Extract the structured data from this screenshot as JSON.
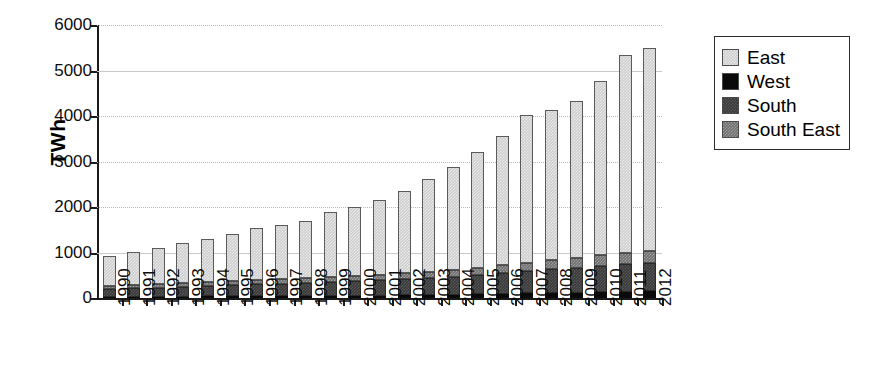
{
  "chart_data": {
    "type": "bar",
    "subtype": "stacked-column",
    "title": "",
    "xlabel": "",
    "ylabel": "TWh",
    "ylim": [
      0,
      6000
    ],
    "ytick_step": 1000,
    "yticks": [
      "6000",
      "5000",
      "4000",
      "3000",
      "2000",
      "1000",
      "0"
    ],
    "grid": true,
    "grid_axis": "y",
    "legend_position": "right-top",
    "legend_entries": [
      "East",
      "West",
      "South",
      "South East"
    ],
    "categories": [
      "1990",
      "1991",
      "1992",
      "1993",
      "1994",
      "1995",
      "1996",
      "1997",
      "1998",
      "1999",
      "2000",
      "2001",
      "2002",
      "2003",
      "2004",
      "2005",
      "2006",
      "2007",
      "2008",
      "2009",
      "2010",
      "2011",
      "2012"
    ],
    "series": [
      {
        "name": "South East",
        "color": "#6e6e6e",
        "values": [
          60,
          65,
          70,
          75,
          80,
          85,
          90,
          95,
          100,
          105,
          110,
          115,
          125,
          135,
          145,
          160,
          175,
          190,
          205,
          220,
          235,
          250,
          265
        ]
      },
      {
        "name": "South",
        "color": "#3a3a3a",
        "values": [
          180,
          190,
          200,
          215,
          230,
          245,
          260,
          275,
          290,
          305,
          320,
          340,
          360,
          380,
          400,
          430,
          460,
          490,
          520,
          550,
          580,
          600,
          620
        ]
      },
      {
        "name": "West",
        "color": "#0a0a0a",
        "values": [
          25,
          28,
          30,
          32,
          35,
          38,
          40,
          43,
          45,
          48,
          50,
          55,
          60,
          65,
          70,
          80,
          90,
          100,
          110,
          120,
          130,
          140,
          150
        ]
      },
      {
        "name": "East",
        "color": "#cdcdcd",
        "values": [
          655,
          727,
          800,
          878,
          955,
          1032,
          1140,
          1187,
          1265,
          1422,
          1520,
          1640,
          1805,
          2040,
          2275,
          2530,
          2845,
          3240,
          3305,
          3440,
          3835,
          4350,
          4465
        ]
      }
    ],
    "totals": [
      920,
      1010,
      1100,
      1200,
      1300,
      1400,
      1530,
      1600,
      1700,
      1880,
      2000,
      2150,
      2350,
      2620,
      2890,
      3200,
      3570,
      4020,
      4140,
      4330,
      4780,
      5340,
      5500
    ],
    "stack_order_bottom_to_top": [
      "West",
      "South",
      "South East",
      "East"
    ]
  }
}
